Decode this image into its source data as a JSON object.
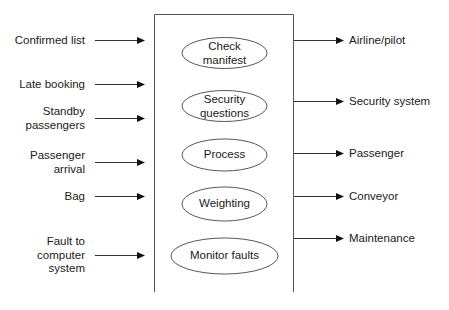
{
  "diagram": {
    "type": "context/process diagram",
    "inputs": [
      {
        "label": "Confirmed list",
        "lines": [
          "Confirmed list"
        ],
        "y": 40
      },
      {
        "label": "Late booking",
        "lines": [
          "Late booking"
        ],
        "y": 84
      },
      {
        "label": "Standby passengers",
        "lines": [
          "Standby",
          "passengers"
        ],
        "y": 118
      },
      {
        "label": "Passenger arrival",
        "lines": [
          "Passenger",
          "arrival"
        ],
        "y": 162
      },
      {
        "label": "Bag",
        "lines": [
          "Bag"
        ],
        "y": 196
      },
      {
        "label": "Fault to computer system",
        "lines": [
          "Fault to",
          "computer",
          "system"
        ],
        "y": 255
      }
    ],
    "processes": [
      {
        "label": "Check manifest",
        "lines": [
          "Check",
          "manifest"
        ],
        "cx": 224.5,
        "cy": 53,
        "rx": 42.5,
        "ry": 15.5
      },
      {
        "label": "Security questions",
        "lines": [
          "Security",
          "questions"
        ],
        "cx": 224.5,
        "cy": 106,
        "rx": 42.5,
        "ry": 15.5
      },
      {
        "label": "Process",
        "lines": [
          "Process"
        ],
        "cx": 224.5,
        "cy": 155,
        "rx": 42.5,
        "ry": 16
      },
      {
        "label": "Weighting",
        "lines": [
          "Weighting"
        ],
        "cx": 224.5,
        "cy": 204,
        "rx": 42.5,
        "ry": 17
      },
      {
        "label": "Monitor faults",
        "lines": [
          "Monitor faults"
        ],
        "cx": 224.5,
        "cy": 256,
        "rx": 53.5,
        "ry": 18
      }
    ],
    "outputs": [
      {
        "label": "Airline/pilot",
        "y": 40
      },
      {
        "label": "Security system",
        "y": 101
      },
      {
        "label": "Passenger",
        "y": 153
      },
      {
        "label": "Conveyor",
        "y": 196
      },
      {
        "label": "Maintenance",
        "y": 238
      }
    ]
  }
}
